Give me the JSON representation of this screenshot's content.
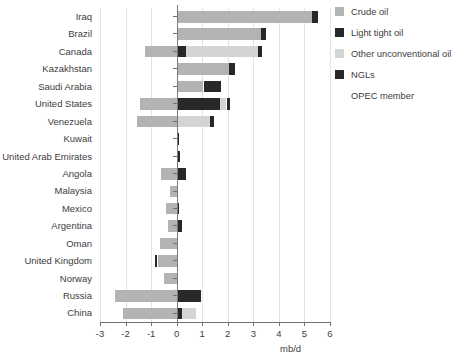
{
  "chart_data": {
    "type": "bar",
    "orientation": "horizontal",
    "stacked": true,
    "title": "",
    "xlabel": "mb/d",
    "ylabel": "",
    "xlim": [
      -3,
      6
    ],
    "xticks": [
      -3,
      -2,
      -1,
      0,
      1,
      2,
      3,
      4,
      5,
      6
    ],
    "xtick_labels": [
      "-3",
      "-2",
      "-1",
      "0",
      "1",
      "2",
      "3",
      "4",
      "5",
      "6"
    ],
    "grid": true,
    "legend_position": "right",
    "categories": [
      "Iraq",
      "Brazil",
      "Canada",
      "Kazakhstan",
      "Saudi Arabia",
      "United States",
      "Venezuela",
      "Kuwait",
      "United Arab Emirates",
      "Angola",
      "Malaysia",
      "Mexico",
      "Argentina",
      "Oman",
      "United Kingdom",
      "Norway",
      "Russia",
      "China"
    ],
    "series": [
      {
        "name": "Crude oil",
        "color": "#b3b3b3",
        "values": [
          5.3,
          3.3,
          -1.25,
          2.05,
          1.05,
          -1.45,
          -1.55,
          0.0,
          0.0,
          -0.6,
          -0.25,
          -0.4,
          -0.35,
          -0.65,
          -0.75,
          -0.5,
          -2.4,
          -2.1
        ]
      },
      {
        "name": "Light tight oil",
        "color": "#282828",
        "values": [
          0.0,
          0.0,
          0.35,
          0.0,
          0.7,
          1.7,
          0.0,
          0.1,
          0.15,
          0.35,
          0.0,
          0.1,
          0.2,
          0.0,
          0.0,
          0.05,
          0.95,
          0.2
        ]
      },
      {
        "name": "Other unconventional oil",
        "color": "#d4d4d4",
        "values": [
          0.0,
          0.0,
          2.85,
          0.0,
          0.0,
          0.25,
          1.3,
          0.0,
          0.0,
          0.0,
          0.0,
          0.0,
          0.0,
          0.0,
          0.0,
          0.0,
          0.0,
          0.55
        ]
      },
      {
        "name": "NGLs",
        "color": "#282828",
        "values": [
          0.25,
          0.2,
          0.15,
          0.25,
          0.0,
          0.15,
          0.15,
          0.0,
          0.0,
          0.0,
          0.0,
          0.0,
          0.0,
          0.0,
          -0.1,
          0.0,
          0.0,
          0.0
        ]
      }
    ]
  },
  "legend": {
    "items": [
      {
        "label": "Crude oil",
        "color": "#b3b3b3",
        "has_swatch": true
      },
      {
        "label": "Light tight oil",
        "color": "#282828",
        "has_swatch": true
      },
      {
        "label": "Other unconventional oil",
        "color": "#d4d4d4",
        "has_swatch": true
      },
      {
        "label": "NGLs",
        "color": "#282828",
        "has_swatch": true
      },
      {
        "label": "OPEC member",
        "color": "",
        "has_swatch": false
      }
    ]
  },
  "axis": {
    "x_title": "mb/d"
  }
}
